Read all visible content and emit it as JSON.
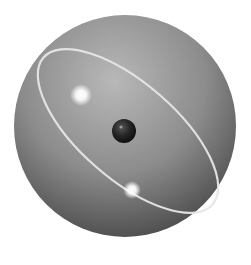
{
  "figure": {
    "colors": {
      "background": "#ffffff",
      "sphere_light": "#b4b4b4",
      "sphere_mid": "#8a8a8a",
      "sphere_dark": "#4a4a4a",
      "ring": "#e8e8e8",
      "core": "#1e1e1e",
      "glow": "#ffffff"
    },
    "sphere": {
      "cx": 125,
      "cy": 126,
      "r": 111
    },
    "orbit": {
      "cx": 128,
      "cy": 131,
      "rx": 112,
      "ry": 48,
      "rotate": 41
    },
    "core": {
      "cx": 124,
      "cy": 131,
      "r": 12
    },
    "glows": [
      {
        "cx": 81,
        "cy": 95,
        "r": 9
      },
      {
        "cx": 132,
        "cy": 190,
        "r": 7
      }
    ]
  }
}
